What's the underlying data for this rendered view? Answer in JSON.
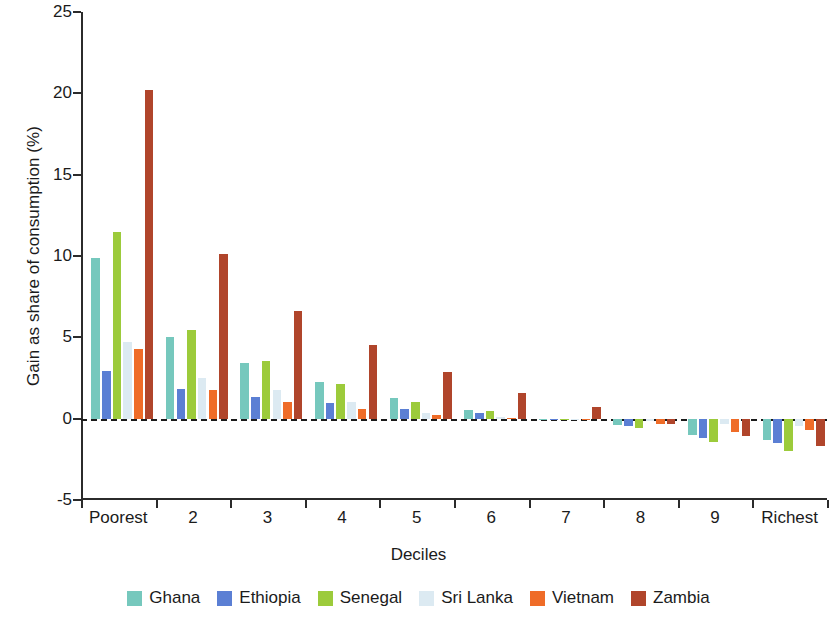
{
  "chart_data": {
    "type": "bar",
    "title": "",
    "xlabel": "Deciles",
    "ylabel": "Gain as share of consumption (%)",
    "categories": [
      "Poorest",
      "2",
      "3",
      "4",
      "5",
      "6",
      "7",
      "8",
      "9",
      "Richest"
    ],
    "ylim": [
      -5,
      25
    ],
    "yticks": [
      -5,
      0,
      5,
      10,
      15,
      20,
      25
    ],
    "ytick_labels": [
      "-5",
      "0",
      "5",
      "10",
      "15",
      "20",
      "25"
    ],
    "grid": false,
    "legend_position": "bottom",
    "zero_reference_line": true,
    "series": [
      {
        "name": "Ghana",
        "color": "#76c8bd",
        "values": [
          9.9,
          5.05,
          3.45,
          2.25,
          1.25,
          0.55,
          -0.05,
          -0.4,
          -1.0,
          -1.3
        ]
      },
      {
        "name": "Ethiopia",
        "color": "#5b7fd4",
        "values": [
          2.95,
          1.85,
          1.35,
          0.95,
          0.6,
          0.35,
          -0.1,
          -0.45,
          -1.2,
          -1.5
        ]
      },
      {
        "name": "Senegal",
        "color": "#9ccb3b",
        "values": [
          11.5,
          5.45,
          3.55,
          2.15,
          1.0,
          0.45,
          -0.1,
          -0.55,
          -1.45,
          -2.0
        ]
      },
      {
        "name": "Sri Lanka",
        "color": "#dceaf2",
        "values": [
          4.7,
          2.5,
          1.75,
          1.05,
          0.35,
          0.1,
          -0.05,
          -0.15,
          -0.35,
          -0.45
        ]
      },
      {
        "name": "Vietnam",
        "color": "#ef6c28",
        "values": [
          4.3,
          1.75,
          1.05,
          0.6,
          0.2,
          0.05,
          -0.05,
          -0.35,
          -0.85,
          -0.7
        ]
      },
      {
        "name": "Zambia",
        "color": "#b0452b",
        "values": [
          20.2,
          10.1,
          6.6,
          4.55,
          2.85,
          1.55,
          0.7,
          -0.3,
          -1.05,
          -1.7
        ]
      }
    ]
  }
}
